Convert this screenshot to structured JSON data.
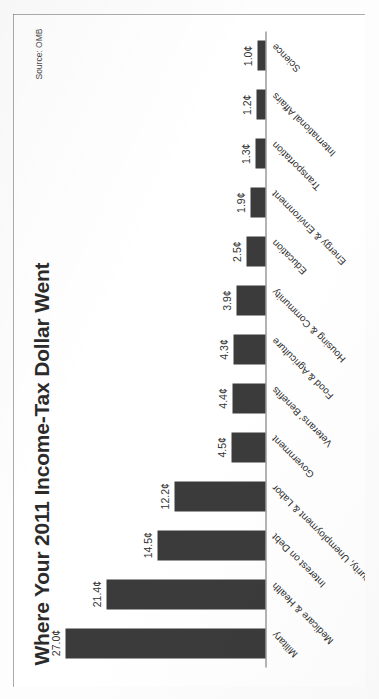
{
  "chart_data": {
    "type": "bar",
    "title": "Where Your 2011 Income-Tax Dollar Went",
    "source": "Source: OMB",
    "xlabel": "",
    "ylabel": "",
    "unit": "¢",
    "orientation": "vertical-bars-rotated-page",
    "grid": false,
    "legend": "none",
    "ylim": [
      0,
      27
    ],
    "categories": [
      "Military",
      "Medicare & Health",
      "Interest on Debt",
      "Social Security, Unemployment & Labor",
      "Government",
      "Veterans' Benefits",
      "Food & Agriculture",
      "Housing & Community",
      "Education",
      "Energy & Environment",
      "Transportation",
      "International Affairs",
      "Science"
    ],
    "values": [
      27.0,
      21.4,
      14.5,
      12.2,
      4.5,
      4.4,
      4.3,
      3.9,
      2.5,
      1.9,
      1.3,
      1.2,
      1.0
    ],
    "value_labels": [
      "27.0¢",
      "21.4¢",
      "14.5¢",
      "12.2¢",
      "4.5¢",
      "4.4¢",
      "4.3¢",
      "3.9¢",
      "2.5¢",
      "1.9¢",
      "1.3¢",
      "1.2¢",
      "1.0¢"
    ],
    "colors": {
      "bar_fill": "#3b3b3b",
      "axis_line": "#6b6b6b",
      "title_text": "#2b2b2b",
      "label_text": "#2f2f2f",
      "page_background": "#ffffff",
      "frame_border": "#555a5e"
    }
  }
}
